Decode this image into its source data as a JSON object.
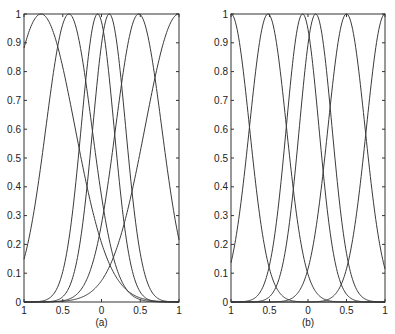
{
  "chart_data": [
    {
      "type": "line",
      "panel_label": "(a)",
      "title": "",
      "xlabel": "",
      "ylabel": "",
      "xlim": [
        -1,
        1
      ],
      "ylim": [
        0,
        1
      ],
      "xtick_labels": [
        "1",
        "0.5",
        "0",
        "0.5",
        "1"
      ],
      "ytick_labels": [
        "0",
        "0.1",
        "0.2",
        "0.3",
        "0.4",
        "0.5",
        "0.6",
        "0.7",
        "0.8",
        "0.9",
        "1"
      ],
      "grid": false,
      "legend": null,
      "series": [
        {
          "name": "basis-1",
          "center": -0.78,
          "width": 0.62
        },
        {
          "name": "basis-2",
          "center": -0.42,
          "width": 0.42
        },
        {
          "name": "basis-3",
          "center": -0.05,
          "width": 0.3
        },
        {
          "name": "basis-4",
          "center": 0.1,
          "width": 0.3
        },
        {
          "name": "basis-5",
          "center": 0.48,
          "width": 0.42
        },
        {
          "name": "basis-6",
          "center": 1.0,
          "width": 0.62
        }
      ]
    },
    {
      "type": "line",
      "panel_label": "(b)",
      "title": "",
      "xlabel": "",
      "ylabel": "",
      "xlim": [
        -1,
        1
      ],
      "ylim": [
        0,
        1
      ],
      "xtick_labels": [
        "1",
        "0.5",
        "0",
        "0.5",
        "1"
      ],
      "ytick_labels": [
        "0",
        "0.1",
        "0.2",
        "0.3",
        "0.4",
        "0.5",
        "0.6",
        "0.7",
        "0.8",
        "0.9",
        "1"
      ],
      "grid": false,
      "legend": null,
      "series": [
        {
          "name": "basis-1",
          "center": -1.0,
          "width": 0.34
        },
        {
          "name": "basis-2",
          "center": -0.52,
          "width": 0.34
        },
        {
          "name": "basis-3",
          "center": -0.07,
          "width": 0.3
        },
        {
          "name": "basis-4",
          "center": 0.1,
          "width": 0.3
        },
        {
          "name": "basis-5",
          "center": 0.5,
          "width": 0.34
        },
        {
          "name": "basis-6",
          "center": 1.0,
          "width": 0.34
        }
      ]
    }
  ],
  "panels": [
    {
      "label": "(a)"
    },
    {
      "label": "(b)"
    }
  ]
}
